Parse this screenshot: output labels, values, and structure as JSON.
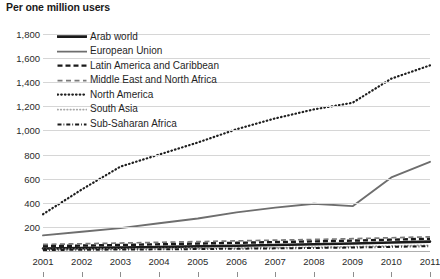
{
  "title": "Per one million users",
  "legend": {
    "items": [
      {
        "label": "Arab world",
        "style": "solid-thick-black",
        "color": "#1a1a1a"
      },
      {
        "label": "European Union",
        "style": "solid-gray",
        "color": "#6e6e6e"
      },
      {
        "label": "Latin America and Caribbean",
        "style": "dashed-bold-black",
        "color": "#1a1a1a"
      },
      {
        "label": "Middle East and North Africa",
        "style": "dashed-gray",
        "color": "#7a7a7a"
      },
      {
        "label": "North America",
        "style": "dotted-black",
        "color": "#1f1f1f"
      },
      {
        "label": "South Asia",
        "style": "dotted-light-gray",
        "color": "#a8a8a8"
      },
      {
        "label": "Sub-Saharan Africa",
        "style": "dash-dot-black",
        "color": "#1a1a1a"
      }
    ]
  },
  "axes": {
    "y_ticks": [
      "1,800",
      "1,600",
      "1,400",
      "1,200",
      "1,000",
      "800",
      "600",
      "400",
      "200"
    ],
    "x_ticks": [
      "2001",
      "2002",
      "2003",
      "2004",
      "2005",
      "2006",
      "2007",
      "2008",
      "2009",
      "2010",
      "2011"
    ]
  },
  "chart_data": {
    "type": "line",
    "title": "Per one million users",
    "xlabel": "",
    "ylabel": "",
    "x": [
      2001,
      2002,
      2003,
      2004,
      2005,
      2006,
      2007,
      2008,
      2009,
      2010,
      2011
    ],
    "ylim": [
      0,
      1900
    ],
    "xlim": [
      2001,
      2011
    ],
    "y_tick_values": [
      200,
      400,
      600,
      800,
      1000,
      1200,
      1400,
      1600,
      1800
    ],
    "grid": true,
    "legend_position": "inside-upper-left",
    "series": [
      {
        "name": "Arab world",
        "style": "solid-thick-black",
        "color": "#1a1a1a",
        "values": [
          20,
          24,
          28,
          33,
          38,
          44,
          50,
          56,
          62,
          70,
          78
        ]
      },
      {
        "name": "European Union",
        "style": "solid-gray",
        "color": "#6e6e6e",
        "values": [
          130,
          160,
          190,
          230,
          270,
          320,
          360,
          392,
          372,
          610,
          740
        ]
      },
      {
        "name": "Latin America and Caribbean",
        "style": "dashed-bold-black",
        "color": "#1a1a1a",
        "values": [
          40,
          45,
          50,
          56,
          62,
          68,
          74,
          80,
          86,
          94,
          102
        ]
      },
      {
        "name": "Middle East and North Africa",
        "style": "dashed-gray",
        "color": "#7a7a7a",
        "values": [
          55,
          60,
          66,
          72,
          78,
          84,
          90,
          96,
          102,
          110,
          118
        ]
      },
      {
        "name": "North America",
        "style": "dotted-black",
        "color": "#1f1f1f",
        "values": [
          305,
          510,
          700,
          800,
          900,
          1010,
          1100,
          1175,
          1230,
          1430,
          1540
        ]
      },
      {
        "name": "South Asia",
        "style": "dotted-light-gray",
        "color": "#a8a8a8",
        "values": [
          12,
          14,
          16,
          19,
          22,
          25,
          28,
          32,
          36,
          42,
          48
        ]
      },
      {
        "name": "Sub-Saharan Africa",
        "style": "dash-dot-black",
        "color": "#1a1a1a",
        "values": [
          8,
          10,
          12,
          14,
          16,
          19,
          22,
          25,
          29,
          34,
          40
        ]
      }
    ]
  }
}
